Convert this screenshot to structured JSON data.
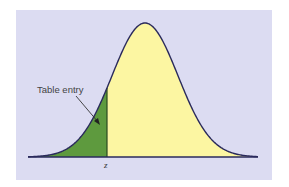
{
  "figure": {
    "type": "normal-distribution-diagram",
    "annotation_label": "Table entry",
    "z_label": "z",
    "colors": {
      "background": "#dcdcf2",
      "shaded_area": "#5e9a3e",
      "unshaded_area": "#fcf6a2",
      "curve": "#2a2a5c",
      "text": "#444444"
    }
  },
  "chart_data": {
    "type": "area",
    "title": "",
    "xlabel": "",
    "ylabel": "",
    "tick_labels": [
      "z"
    ],
    "annotations": [
      {
        "text": "Table entry",
        "points_to": "shaded area left of z"
      }
    ],
    "shaded_region": {
      "from": "-inf",
      "to": "z",
      "z_value_approx": -1.15
    },
    "grid": false,
    "legend": null
  }
}
